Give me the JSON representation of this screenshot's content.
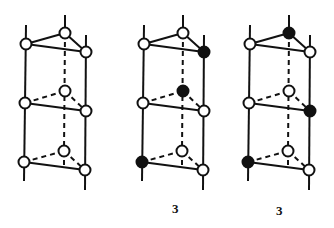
{
  "diagram": {
    "colors": {
      "line": "#111111",
      "open_node_fill": "#ffffff",
      "filled_node": "#111111",
      "background": "#ffffff"
    },
    "panels": [
      {
        "id": "panel-1",
        "offset_x": 0,
        "label": "",
        "nodes": {
          "top_back": "open",
          "top_left": "open",
          "top_right": "open",
          "mid_back": "open",
          "mid_left": "open",
          "mid_right": "open",
          "bot_back": "open",
          "bot_left": "open",
          "bot_right": "open"
        }
      },
      {
        "id": "panel-2",
        "offset_x": 118,
        "label": "3",
        "nodes": {
          "top_back": "open",
          "top_left": "open",
          "top_right": "filled",
          "mid_back": "filled",
          "mid_left": "open",
          "mid_right": "open",
          "bot_back": "open",
          "bot_left": "filled",
          "bot_right": "open"
        }
      },
      {
        "id": "panel-3",
        "offset_x": 224,
        "label": "3",
        "nodes": {
          "top_back": "filled",
          "top_left": "open",
          "top_right": "open",
          "mid_back": "open",
          "mid_left": "open",
          "mid_right": "filled",
          "bot_back": "open",
          "bot_left": "filled",
          "bot_right": "open"
        }
      }
    ]
  }
}
